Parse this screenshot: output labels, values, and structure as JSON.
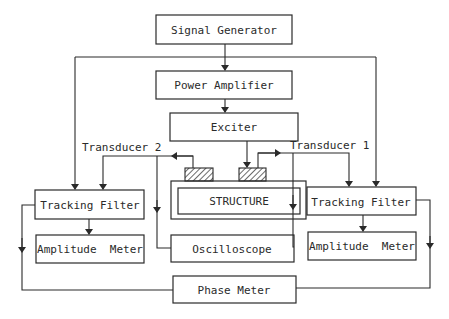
{
  "diagram": {
    "blocks": {
      "signal_generator": "Signal Generator",
      "power_amplifier": "Power Amplifier",
      "exciter": "Exciter",
      "structure": "STRUCTURE",
      "tracking_filter_left": "Tracking Filter",
      "tracking_filter_right": "Tracking Filter",
      "amplitude_meter_left": "Amplitude  Meter",
      "amplitude_meter_right": "Amplitude  Meter",
      "oscilloscope": "Oscilloscope",
      "phase_meter": "Phase Meter"
    },
    "labels": {
      "transducer_2": "Transducer 2",
      "transducer_1": "Transducer 1"
    },
    "connections": [
      {
        "from": "Signal Generator",
        "to": "Power Amplifier"
      },
      {
        "from": "Signal Generator",
        "to": "Tracking Filter (left)"
      },
      {
        "from": "Signal Generator",
        "to": "Tracking Filter (right)"
      },
      {
        "from": "Power Amplifier",
        "to": "Exciter"
      },
      {
        "from": "Exciter",
        "to": "Transducer 1 / STRUCTURE"
      },
      {
        "from": "Transducer 2",
        "to": "Tracking Filter (left)"
      },
      {
        "from": "Transducer 2",
        "to": "Oscilloscope"
      },
      {
        "from": "Transducer 1",
        "to": "Tracking Filter (right)"
      },
      {
        "from": "Transducer 1",
        "to": "Oscilloscope"
      },
      {
        "from": "Tracking Filter (left)",
        "to": "Amplitude Meter (left)"
      },
      {
        "from": "Tracking Filter (right)",
        "to": "Amplitude Meter (right)"
      },
      {
        "from": "Tracking Filter (left)",
        "to": "Phase Meter"
      },
      {
        "from": "Tracking Filter (right)",
        "to": "Phase Meter"
      }
    ]
  }
}
